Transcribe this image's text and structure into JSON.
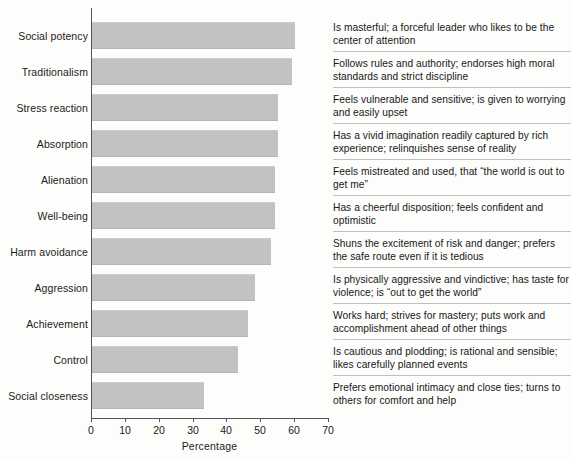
{
  "chart_data": {
    "type": "bar",
    "orientation": "horizontal",
    "title": "",
    "xlabel": "Percentage",
    "ylabel": "",
    "xlim": [
      0,
      70
    ],
    "xticks": [
      0,
      10,
      20,
      30,
      40,
      50,
      60,
      70
    ],
    "grid": false,
    "legend": false,
    "bar_color": "#c2c2c2",
    "axis_color": "#55545a",
    "categories": [
      "Social potency",
      "Traditionalism",
      "Stress reaction",
      "Absorption",
      "Alienation",
      "Well-being",
      "Harm avoidance",
      "Aggression",
      "Achievement",
      "Control",
      "Social closeness"
    ],
    "values": [
      60,
      59,
      55,
      55,
      54,
      54,
      53,
      48,
      46,
      43,
      33
    ],
    "descriptions": [
      "Is masterful; a forceful leader who likes to be the center of attention",
      "Follows rules and authority; endorses high moral standards and strict discipline",
      "Feels vulnerable and sensitive; is given to worrying and easily upset",
      "Has a vivid imagination readily captured by rich experience; relinquishes sense of reality",
      "Feels mistreated and used, that “the world is out to get me”",
      "Has a cheerful disposition; feels confident and optimistic",
      "Shuns the excitement of risk and danger; prefers the safe route even if it is tedious",
      "Is physically aggressive and vindictive; has taste for violence; is “out to get the world”",
      "Works hard; strives for mastery; puts work and accomplishment ahead of other things",
      "Is cautious and plodding; is rational and sensible; likes carefully planned events",
      "Prefers emotional intimacy and close ties; turns to others for comfort and help"
    ]
  }
}
